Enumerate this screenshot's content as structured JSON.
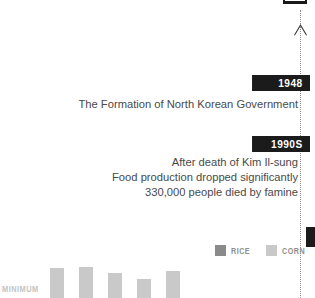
{
  "axis": {
    "arrow_icon": "arrow-up-icon",
    "line_style": "dotted"
  },
  "events": [
    {
      "year_label": "1948",
      "description_lines": [
        "The Formation of North Korean Government"
      ]
    },
    {
      "year_label": "1990S",
      "description_lines": [
        "After death of Kim Il-sung",
        "Food production dropped significantly",
        "330,000 people died by famine"
      ]
    }
  ],
  "legend": {
    "items": [
      {
        "label": "RICE",
        "color": "#8a8a8a"
      },
      {
        "label": "CORN",
        "color": "#c9c9c9"
      }
    ]
  },
  "baseline": {
    "label": "MINIMUM"
  },
  "colors": {
    "badge_background": "#1b1b1b",
    "badge_text": "#ffffff",
    "body_text": "#4a4a4a",
    "muted_text": "#8e8e8e",
    "baseline_text": "#c3c3c3",
    "axis": "#8c8c8c"
  },
  "chart_data": {
    "type": "bar",
    "title": "",
    "xlabel": "",
    "ylabel": "",
    "grid": false,
    "legend_position": "above-right",
    "categories": [
      "1",
      "2",
      "3",
      "4",
      "5"
    ],
    "series": [
      {
        "name": "CORN",
        "color": "#c9c9c9",
        "values": [
          30,
          31,
          25,
          19,
          27
        ]
      }
    ],
    "ylim": [
      0,
      108
    ],
    "bars": [
      {
        "x": 50,
        "height": 30,
        "color": "#c9c9c9"
      },
      {
        "x": 79,
        "height": 31,
        "color": "#c9c9c9"
      },
      {
        "x": 108,
        "height": 25,
        "color": "#c9c9c9"
      },
      {
        "x": 137,
        "height": 19,
        "color": "#c9c9c9"
      },
      {
        "x": 166,
        "height": 27,
        "color": "#c9c9c9"
      }
    ]
  }
}
